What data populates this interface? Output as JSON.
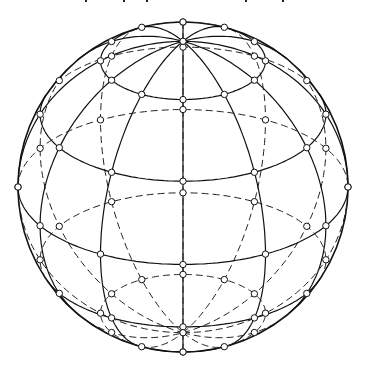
{
  "figure": {
    "caption_visible": false,
    "center": [
      183,
      187
    ],
    "radius": 165,
    "poles": [
      [
        183,
        42
      ],
      [
        183,
        332
      ]
    ],
    "colors": {
      "line": "#111111",
      "background": "#ffffff",
      "node_fill": "#ffffff"
    },
    "caption_marks_x": [
      85,
      123,
      146,
      245,
      282
    ]
  }
}
